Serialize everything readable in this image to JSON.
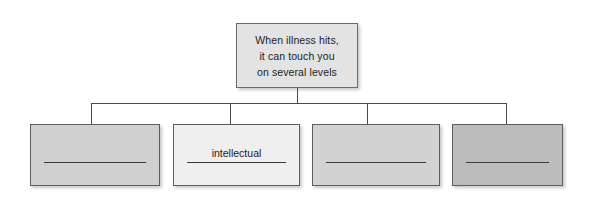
{
  "diagram": {
    "type": "hierarchy",
    "title_box": {
      "name": "root-concept",
      "lines": [
        "When illness hits,",
        "it can touch you",
        "on several levels"
      ],
      "fill": "#e3e3e3",
      "border": "#6a6a6a"
    },
    "connector": {
      "style": "orthogonal-bus",
      "color": "#4a4a4a"
    },
    "children": [
      {
        "index": 1,
        "label": "",
        "answer_line": true,
        "fill": "#d0d0d0",
        "border": "#5e5e5e"
      },
      {
        "index": 2,
        "label": "intellectual",
        "answer_line": true,
        "fill": "#efefef",
        "border": "#5e5e5e"
      },
      {
        "index": 3,
        "label": "",
        "answer_line": true,
        "fill": "#d2d2d2",
        "border": "#5e5e5e"
      },
      {
        "index": 4,
        "label": "",
        "answer_line": true,
        "fill": "#bcbcbc",
        "border": "#5e5e5e"
      }
    ],
    "background": "#ffffff"
  }
}
